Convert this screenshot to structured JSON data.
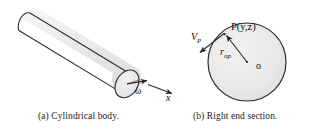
{
  "figure": {
    "panels": [
      {
        "id": "a",
        "caption": "(a)  Cylindrical body.",
        "labels": {
          "omega": "ω",
          "x_axis": "x"
        }
      },
      {
        "id": "b",
        "caption": "(b)  Right end section.",
        "labels": {
          "velocity": "V",
          "velocity_sub": "P",
          "point": "P(y,z)",
          "radius": "r",
          "radius_sub": "op",
          "origin": "o"
        }
      }
    ]
  },
  "colors": {
    "stroke": "#2b2b2b",
    "cylinder_fill": "#efefef",
    "circle_fill": "#e8e8e8",
    "text": "#111111",
    "background": "#ffffff"
  }
}
